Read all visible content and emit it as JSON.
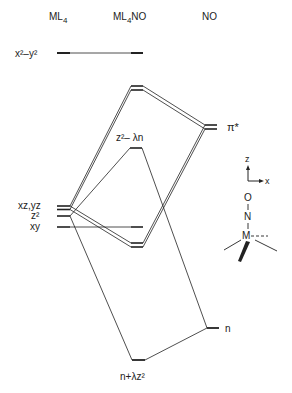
{
  "headers": {
    "left": "ML",
    "left_sub": "4",
    "middle": "ML",
    "middle_sub": "4",
    "middle_suffix": "NO",
    "right": "NO"
  },
  "levels": {
    "x2y2": "x²–y²",
    "xzyz": "xz,yz",
    "z2": "z²",
    "xy": "xy",
    "pistar": "π*",
    "z2_lambda_n": "z²– λn",
    "n": "n",
    "n_lambda_z2": "n+λz²"
  },
  "axes": {
    "z": "z",
    "x": "x"
  },
  "molecule": {
    "O": "O",
    "N": "N",
    "M": "M"
  },
  "colors": {
    "ink": "#222222",
    "background": "#ffffff"
  }
}
